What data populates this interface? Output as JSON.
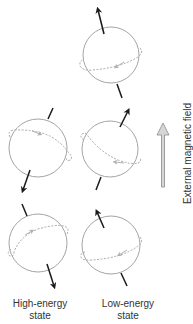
{
  "colors": {
    "sphere_outline": "#9a9a9a",
    "spin_arrow": "#1a1a1a",
    "orbit_dash": "#a8a8a8",
    "field_arrow_fill": "#d6d6d6",
    "field_arrow_stroke": "#8a8a8a",
    "text": "#333333"
  },
  "labels": {
    "high_energy_line1": "High-energy",
    "high_energy_line2": "state",
    "low_energy_line1": "Low-energy",
    "low_energy_line2": "state",
    "field": "External magnetic field"
  },
  "spheres": [
    {
      "id": "top-low",
      "cx": 111,
      "cy": 55,
      "r": 28,
      "spin": "up",
      "state": "low-energy"
    },
    {
      "id": "mid-high",
      "cx": 38,
      "cy": 148,
      "r": 29,
      "spin": "down",
      "state": "high-energy"
    },
    {
      "id": "mid-low",
      "cx": 110,
      "cy": 149,
      "r": 28,
      "spin": "up",
      "state": "low-energy"
    },
    {
      "id": "bottom-high",
      "cx": 38,
      "cy": 243,
      "r": 29,
      "spin": "down",
      "state": "high-energy"
    },
    {
      "id": "bottom-low",
      "cx": 111,
      "cy": 245,
      "r": 29,
      "spin": "up",
      "state": "low-energy"
    }
  ]
}
